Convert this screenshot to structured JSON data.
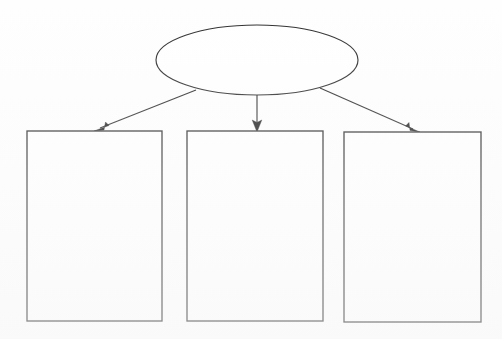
{
  "document": {
    "title": "Blank Concept Map Organizer",
    "background_color": "#fefefe",
    "stroke_color": "#2b2b2b",
    "arrow_color": "#1e1e1e",
    "fill_color": "#ffffff"
  },
  "diagram": {
    "type": "hierarchy",
    "orientation": "top-down",
    "levels": 2,
    "root": {
      "id": "root-ellipse",
      "shape": "ellipse",
      "label": "",
      "center_x": 257,
      "center_y": 60,
      "radius_x": 101,
      "radius_y": 35
    },
    "children": [
      {
        "id": "box-left",
        "shape": "rectangle",
        "label": "",
        "x": 27,
        "y": 131,
        "width": 135,
        "height": 190
      },
      {
        "id": "box-center",
        "shape": "rectangle",
        "label": "",
        "x": 187,
        "y": 131,
        "width": 136,
        "height": 190
      },
      {
        "id": "box-right",
        "shape": "rectangle",
        "label": "",
        "x": 344,
        "y": 132,
        "width": 137,
        "height": 190
      }
    ],
    "connectors": [
      {
        "id": "arrow-root-to-left",
        "label": "",
        "from": "root-ellipse",
        "to": "box-left",
        "x1": 196,
        "y1": 90,
        "x2": 96,
        "y2": 130,
        "arrowhead": "end"
      },
      {
        "id": "arrow-root-to-center",
        "label": "",
        "from": "root-ellipse",
        "to": "box-center",
        "x1": 257,
        "y1": 95,
        "x2": 257,
        "y2": 130,
        "arrowhead": "end"
      },
      {
        "id": "arrow-root-to-right",
        "label": "",
        "from": "root-ellipse",
        "to": "box-right",
        "x1": 320,
        "y1": 88,
        "x2": 418,
        "y2": 131,
        "arrowhead": "end"
      }
    ]
  }
}
